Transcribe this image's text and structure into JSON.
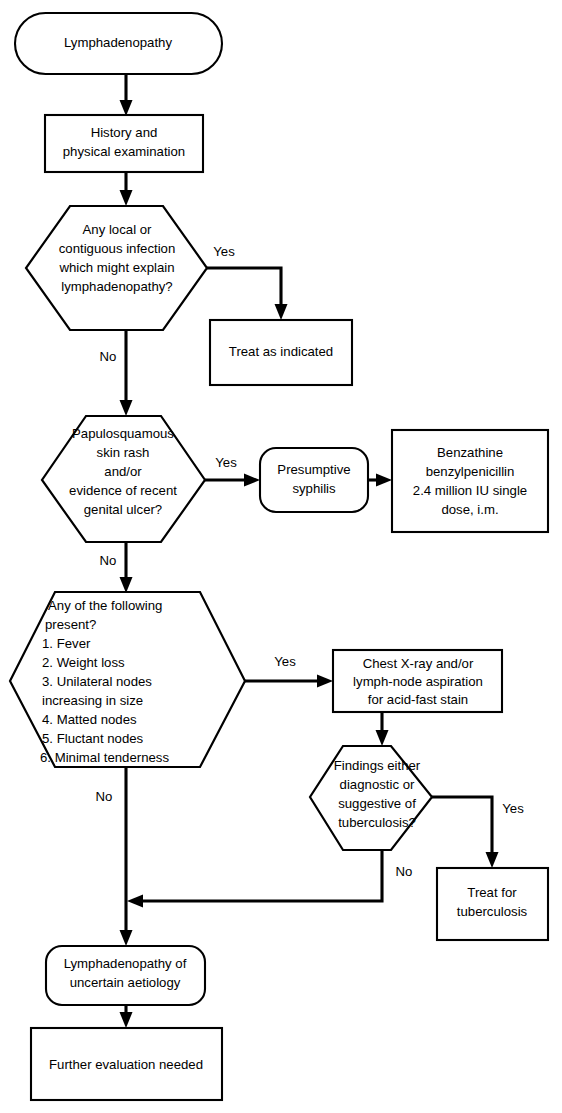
{
  "diagram": {
    "colors": {
      "background": "#ffffff",
      "stroke": "#000000",
      "text": "#000000"
    },
    "nodes": {
      "start": {
        "text": "Lymphadenopathy",
        "shape": "stadium"
      },
      "history": {
        "line1": "History and",
        "line2": "physical examination",
        "shape": "rect"
      },
      "decision_infection": {
        "line1": "Any local or",
        "line2": "contiguous infection",
        "line3": "which might explain",
        "line4": "lymphadenopathy?",
        "shape": "hexagon"
      },
      "treat_indicated": {
        "text": "Treat as indicated",
        "shape": "rect"
      },
      "decision_rash": {
        "line1": "Papulosquamous",
        "line2": "skin rash",
        "line3": "and/or",
        "line4": "evidence of recent",
        "line5": "genital ulcer?",
        "shape": "hexagon"
      },
      "presumptive_syphilis": {
        "line1": "Presumptive",
        "line2": "syphilis",
        "shape": "stadium"
      },
      "benzathine": {
        "line1": "Benzathine",
        "line2": "benzylpenicillin",
        "line3": "2.4 million IU single",
        "line4": "dose, i.m.",
        "shape": "rect"
      },
      "decision_signs": {
        "heading1": "Any of the following",
        "heading2": "present?",
        "items": [
          "1. Fever",
          "2. Weight loss",
          "3. Unilateral nodes",
          "    increasing in size",
          "4. Matted nodes",
          "5. Fluctant nodes",
          "6. Minimal tenderness"
        ],
        "shape": "hexagon"
      },
      "chest_xray": {
        "line1": "Chest X-ray and/or",
        "line2": "lymph-node aspiration",
        "line3": "for acid-fast stain",
        "shape": "rect"
      },
      "decision_tb": {
        "line1": "Findings either",
        "line2": "diagnostic or",
        "line3": "suggestive of",
        "line4": "tuberculosis?",
        "shape": "hexagon"
      },
      "treat_tb": {
        "line1": "Treat for",
        "line2": "tuberculosis",
        "shape": "rect"
      },
      "uncertain": {
        "line1": "Lymphadenopathy of",
        "line2": "uncertain aetiology",
        "shape": "stadium"
      },
      "further_eval": {
        "text": "Further evaluation needed",
        "shape": "rect"
      }
    },
    "edge_labels": {
      "infection_yes": "Yes",
      "infection_no": "No",
      "rash_yes": "Yes",
      "rash_no": "No",
      "signs_yes": "Yes",
      "signs_no": "No",
      "tb_yes": "Yes",
      "tb_no": "No"
    }
  }
}
